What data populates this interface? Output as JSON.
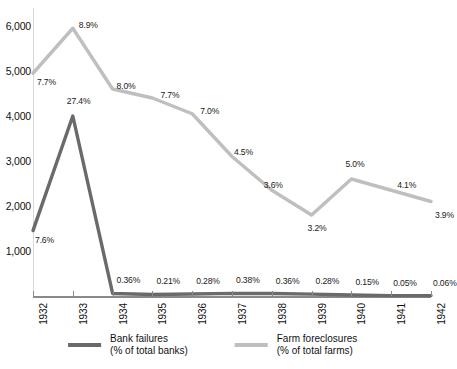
{
  "chart_data": {
    "type": "line",
    "title": "",
    "xlabel": "",
    "ylabel": "",
    "x": [
      1932,
      1933,
      1934,
      1935,
      1936,
      1937,
      1938,
      1939,
      1940,
      1941,
      1942
    ],
    "xtick_labels": [
      "1932",
      "1933",
      "1934",
      "1935",
      "1936",
      "1937",
      "1938",
      "1939",
      "1940",
      "1941",
      "1942"
    ],
    "ytick_labels": [
      "1,000",
      "2,000",
      "3,000",
      "4,000",
      "5,000",
      "6,000"
    ],
    "ytick_values": [
      1000,
      2000,
      3000,
      4000,
      5000,
      6000
    ],
    "ylim": [
      0,
      6400
    ],
    "grid": false,
    "legend_position": "bottom",
    "series": [
      {
        "name": "Bank failures",
        "sublabel": "(% of total banks)",
        "color": "#6a6a6a",
        "values": [
          1453,
          4000,
          57,
          34,
          44,
          59,
          54,
          42,
          23,
          8,
          9
        ],
        "labels": [
          "7.6%",
          "27.4%",
          "0.36%",
          "0.21%",
          "0.28%",
          "0.38%",
          "0.36%",
          "0.28%",
          "0.15%",
          "0.05%",
          "0.06%"
        ]
      },
      {
        "name": "Farm foreclosures",
        "sublabel": "(% of total farms)",
        "color": "#bfbfbf",
        "values": [
          4950,
          5950,
          4600,
          4400,
          4050,
          3100,
          2350,
          1800,
          2600,
          2350,
          2100
        ],
        "labels": [
          "7.7%",
          "8.9%",
          "8.0%",
          "7.7%",
          "7.0%",
          "4.5%",
          "3.6%",
          "3.2%",
          "5.0%",
          "4.1%",
          "3.9%"
        ]
      }
    ]
  },
  "legend": {
    "items": [
      {
        "name": "Bank failures",
        "sub": "(% of total banks)",
        "color": "#6a6a6a"
      },
      {
        "name": "Farm foreclosures",
        "sub": "(% of total farms)",
        "color": "#bfbfbf"
      }
    ]
  }
}
